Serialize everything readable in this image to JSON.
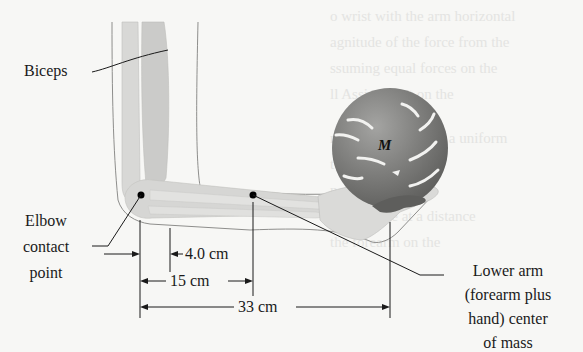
{
  "figure": {
    "type": "physics-diagram"
  },
  "labels": {
    "biceps": "Biceps",
    "elbow": [
      "Elbow",
      "contact",
      "point"
    ],
    "mass": "M",
    "com": [
      "Lower arm",
      "(forearm plus",
      "hand) center",
      "of mass"
    ]
  },
  "dimensions": {
    "biceps_distance": "4.0 cm",
    "com_distance": "15 cm",
    "ball_distance": "33 cm"
  },
  "colors": {
    "background": "#f7f7f5",
    "arm_fill": "#dcdcda",
    "muscle_fill": "#cdcdcb",
    "outline": "#8e8e8c",
    "ball": "#7a7a78",
    "ink": "#1a1a1a"
  },
  "bleed_text": [
    "o wrist with the arm horizontal",
    "agnitude of the force from the",
    "ssuming equal forces on the",
    "ll Assignment on the",
    "nstant expressed as a uniform",
    "ted to a distance",
    "n diameter of",
    "pulley wire at a distance",
    "the forearm on the"
  ]
}
